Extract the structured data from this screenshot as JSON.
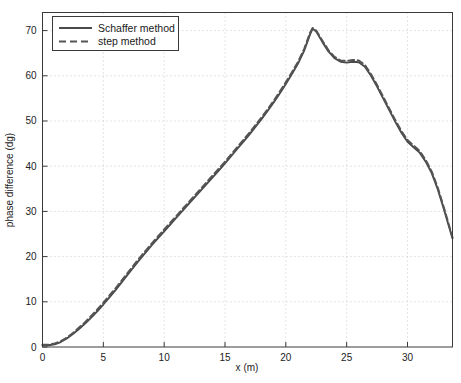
{
  "chart_data": {
    "type": "line",
    "title": "",
    "xlabel": "x (m)",
    "ylabel": "phase difference (dg)",
    "xlim": [
      0,
      33.7
    ],
    "ylim": [
      0,
      74
    ],
    "xticks": [
      0,
      5,
      10,
      15,
      20,
      25,
      30
    ],
    "yticks": [
      0,
      10,
      20,
      30,
      40,
      50,
      60,
      70
    ],
    "grid": "dotted",
    "legend_position": "top-left",
    "x": [
      0,
      0.5,
      1,
      1.5,
      2,
      2.5,
      3,
      3.5,
      4,
      4.5,
      5,
      5.5,
      6,
      6.5,
      7,
      7.5,
      8,
      8.5,
      9,
      9.5,
      10,
      10.5,
      11,
      11.5,
      12,
      12.5,
      13,
      13.5,
      14,
      14.5,
      15,
      15.5,
      16,
      16.5,
      17,
      17.5,
      18,
      18.5,
      19,
      19.5,
      20,
      20.5,
      21,
      21.5,
      22,
      22.2,
      22.5,
      23,
      23.5,
      24,
      24.5,
      25,
      25.5,
      26,
      26.5,
      27,
      27.5,
      28,
      28.5,
      29,
      29.5,
      30,
      30.5,
      31,
      31.5,
      32,
      32.5,
      33,
      33.7
    ],
    "series": [
      {
        "name": "Schaffer method",
        "style": "solid",
        "color": "#4a4a4a",
        "values": [
          0.4,
          0.4,
          0.6,
          1.1,
          1.9,
          2.9,
          4.0,
          5.2,
          6.5,
          7.9,
          9.4,
          11.0,
          12.6,
          14.3,
          16.0,
          17.7,
          19.4,
          21.0,
          22.6,
          24.1,
          25.6,
          27.1,
          28.6,
          30.1,
          31.6,
          33.1,
          34.6,
          36.1,
          37.6,
          39.1,
          40.6,
          42.2,
          43.8,
          45.4,
          47.0,
          48.7,
          50.4,
          52.2,
          54.1,
          56.1,
          58.2,
          60.4,
          62.7,
          65.5,
          69.2,
          70.4,
          69.8,
          67.5,
          65.4,
          63.9,
          63.1,
          62.9,
          63.1,
          63.0,
          62.0,
          60.0,
          57.6,
          55.0,
          52.4,
          49.8,
          47.4,
          45.4,
          44.2,
          43.0,
          41.0,
          38.4,
          34.8,
          30.4,
          24.0
        ]
      },
      {
        "name": "step method",
        "style": "dashed",
        "color": "#555555",
        "values": [
          0.5,
          0.5,
          0.8,
          1.3,
          2.1,
          3.1,
          4.3,
          5.5,
          6.9,
          8.3,
          9.8,
          11.4,
          13.0,
          14.7,
          16.4,
          18.1,
          19.8,
          21.4,
          23.0,
          24.5,
          26.0,
          27.5,
          29.0,
          30.5,
          32.0,
          33.5,
          35.0,
          36.5,
          38.0,
          39.5,
          41.0,
          42.6,
          44.2,
          45.8,
          47.4,
          49.1,
          50.8,
          52.6,
          54.5,
          56.5,
          58.6,
          60.8,
          63.1,
          65.9,
          69.6,
          70.6,
          70.0,
          67.8,
          65.7,
          64.2,
          63.4,
          63.3,
          63.5,
          63.4,
          62.4,
          60.4,
          58.0,
          55.4,
          52.8,
          50.2,
          47.8,
          45.8,
          44.6,
          43.4,
          41.4,
          38.8,
          35.2,
          30.8,
          24.3
        ]
      }
    ]
  },
  "legend": {
    "entries": [
      {
        "label": "Schaffer method",
        "marker": "solid-line-swatch"
      },
      {
        "label": "step method",
        "marker": "dashed-line-swatch"
      }
    ]
  },
  "axes": {
    "x_title": "x (m)",
    "y_title": "phase difference (dg)",
    "x_tick_labels": [
      "0",
      "5",
      "10",
      "15",
      "20",
      "25",
      "30"
    ],
    "y_tick_labels": [
      "0",
      "10",
      "20",
      "30",
      "40",
      "50",
      "60",
      "70"
    ]
  },
  "colors": {
    "background": "#ffffff",
    "frame": "#3a3a3a",
    "grid": "#bdbdbd",
    "line_primary": "#4a4a4a",
    "line_secondary": "#555555",
    "text": "#222222"
  }
}
